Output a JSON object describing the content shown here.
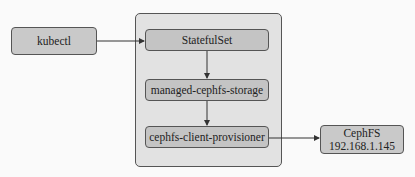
{
  "diagram": {
    "nodes": {
      "kubectl": {
        "label": "kubectl"
      },
      "statefulset": {
        "label": "StatefulSet"
      },
      "managed_storage": {
        "label": "managed-cephfs-storage"
      },
      "provisioner": {
        "label": "cephfs-client-provisioner"
      },
      "cephfs": {
        "label": "CephFS",
        "address": "192.168.1.145"
      }
    },
    "edges": [
      {
        "from": "kubectl",
        "to": "statefulset"
      },
      {
        "from": "statefulset",
        "to": "managed_storage"
      },
      {
        "from": "managed_storage",
        "to": "provisioner"
      },
      {
        "from": "provisioner",
        "to": "cephfs"
      }
    ],
    "colors": {
      "node_fill": "#c9c9c9",
      "container_fill": "#e2e2e2",
      "border": "#555555",
      "background": "#fafafa"
    }
  }
}
